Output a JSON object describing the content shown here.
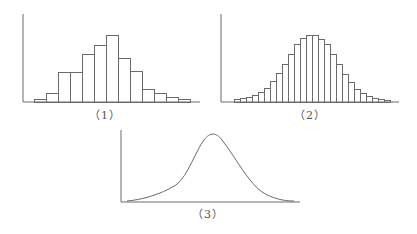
{
  "figures": [
    {
      "id": "1",
      "label": "（1）",
      "type": "histogram",
      "axis": {
        "x0": 23,
        "y_top": 14,
        "baseline": 102,
        "x_end": 200
      },
      "bar_start_x": 34,
      "bar_width": 12,
      "bar_tops": [
        99,
        93,
        72,
        72,
        54,
        45,
        35,
        58,
        71,
        89,
        93,
        97,
        99
      ],
      "label_pos": {
        "x": 105,
        "y": 106
      }
    },
    {
      "id": "2",
      "label": "（2）",
      "type": "histogram",
      "axis": {
        "x0": 221,
        "y_top": 14,
        "baseline": 102,
        "x_end": 399
      },
      "bar_start_x": 234,
      "bar_width": 6,
      "bar_tops": [
        99,
        98,
        97,
        95,
        92,
        88,
        81,
        73,
        64,
        54,
        44,
        38,
        35,
        35,
        39,
        44,
        54,
        64,
        74,
        82,
        89,
        93,
        96,
        98,
        99,
        100
      ],
      "label_pos": {
        "x": 310,
        "y": 106
      }
    },
    {
      "id": "3",
      "label": "（3）",
      "type": "density-curve",
      "axis": {
        "x0": 121,
        "y_top": 130,
        "baseline": 202,
        "x_end": 300
      },
      "curve_path": "M127,201 C140,200 160,195 176,185 C188,176 196,150 204,140 C210,132 216,132 222,140 C236,158 248,182 262,192 C272,198 282,201 294,201",
      "label_pos": {
        "x": 208,
        "y": 205
      }
    }
  ],
  "colors": {
    "line": "#6b6b6b",
    "label": "#555555",
    "background": "#ffffff"
  },
  "chart_data": [
    {
      "type": "bar",
      "title": "（1）",
      "categories": [
        "1",
        "2",
        "3",
        "4",
        "5",
        "6",
        "7",
        "8",
        "9",
        "10",
        "11",
        "12",
        "13"
      ],
      "values": [
        3,
        9,
        30,
        30,
        48,
        57,
        67,
        44,
        31,
        13,
        9,
        5,
        3
      ],
      "xlabel": "",
      "ylabel": "",
      "grid": false
    },
    {
      "type": "bar",
      "title": "（2）",
      "categories": [
        "1",
        "2",
        "3",
        "4",
        "5",
        "6",
        "7",
        "8",
        "9",
        "10",
        "11",
        "12",
        "13",
        "14",
        "15",
        "16",
        "17",
        "18",
        "19",
        "20",
        "21",
        "22",
        "23",
        "24",
        "25",
        "26"
      ],
      "values": [
        3,
        4,
        5,
        7,
        10,
        14,
        21,
        29,
        38,
        48,
        58,
        64,
        67,
        67,
        63,
        58,
        48,
        38,
        28,
        20,
        13,
        9,
        6,
        4,
        3,
        2
      ],
      "xlabel": "",
      "ylabel": "",
      "grid": false
    },
    {
      "type": "line",
      "title": "（3）",
      "description": "smooth unimodal density curve (normal-like)",
      "x": [
        0,
        1,
        2,
        3,
        4,
        5,
        6,
        7,
        8,
        9,
        10
      ],
      "values": [
        1,
        3,
        8,
        17,
        45,
        70,
        48,
        22,
        9,
        3,
        1
      ],
      "xlabel": "",
      "ylabel": "",
      "grid": false
    }
  ]
}
